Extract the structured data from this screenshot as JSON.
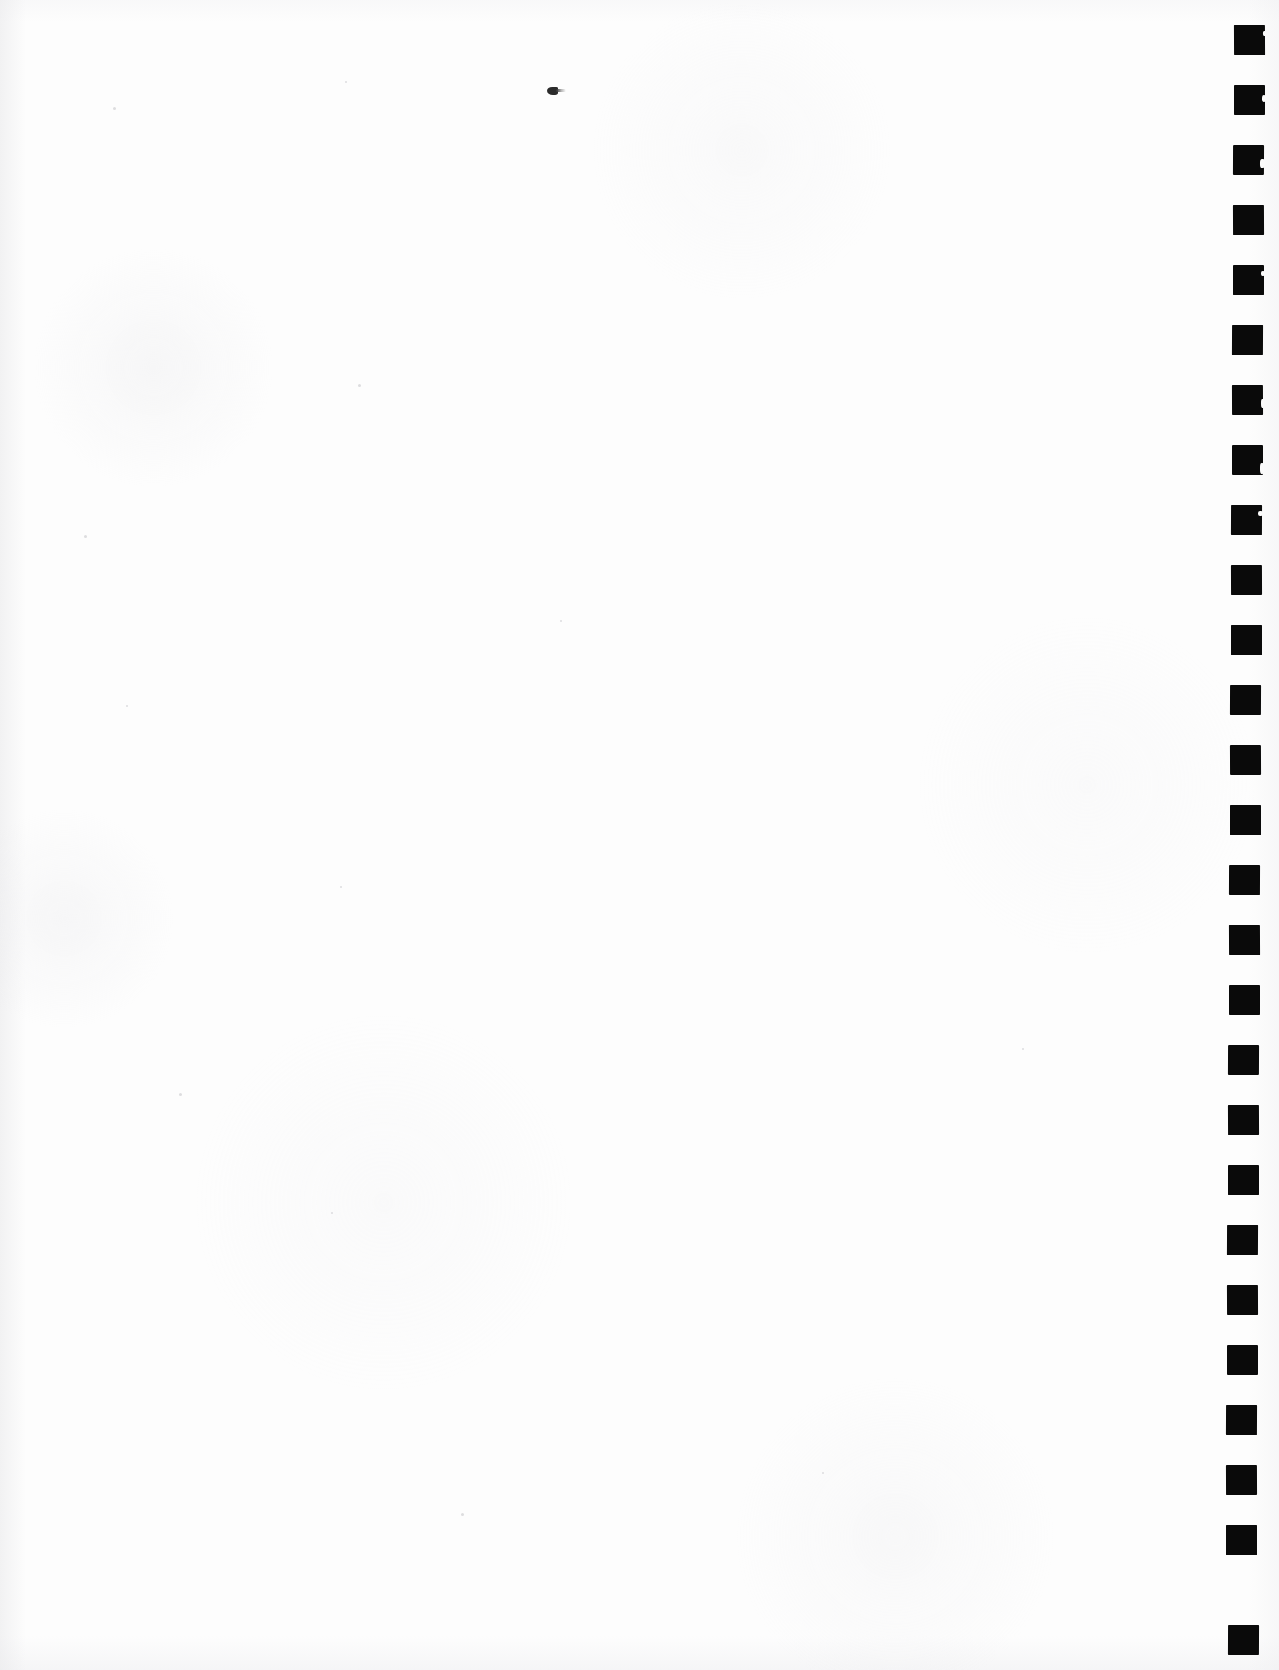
{
  "document": {
    "title": "Scanned Blank Page",
    "page_width": 1279,
    "page_height": 1670,
    "background_color": "#fdfdfd",
    "content_text": "",
    "description": "Blank scanned sheet with a vertical column of solid black registration marks along the right edge"
  },
  "registration_marks": {
    "name": "registration-mark-column",
    "count": 27,
    "color": "#0a0a0a",
    "mark_width": 31,
    "mark_height": 30,
    "spacing": 60,
    "first_top": 25,
    "base_left": 1234,
    "skew_per_mark": -0.22,
    "items": [
      {
        "index": 1,
        "top": 25,
        "left": 1234,
        "nick": true
      },
      {
        "index": 2,
        "top": 85,
        "left": 1234,
        "nick": true
      },
      {
        "index": 3,
        "top": 145,
        "left": 1233,
        "nick": true
      },
      {
        "index": 4,
        "top": 205,
        "left": 1233,
        "nick": false
      },
      {
        "index": 5,
        "top": 265,
        "left": 1233,
        "nick": true
      },
      {
        "index": 6,
        "top": 325,
        "left": 1232,
        "nick": false
      },
      {
        "index": 7,
        "top": 385,
        "left": 1232,
        "nick": true
      },
      {
        "index": 8,
        "top": 445,
        "left": 1232,
        "nick": true
      },
      {
        "index": 9,
        "top": 505,
        "left": 1231,
        "nick": true
      },
      {
        "index": 10,
        "top": 565,
        "left": 1231,
        "nick": false
      },
      {
        "index": 11,
        "top": 625,
        "left": 1231,
        "nick": false
      },
      {
        "index": 12,
        "top": 685,
        "left": 1230,
        "nick": false
      },
      {
        "index": 13,
        "top": 745,
        "left": 1230,
        "nick": false
      },
      {
        "index": 14,
        "top": 805,
        "left": 1230,
        "nick": false
      },
      {
        "index": 15,
        "top": 865,
        "left": 1229,
        "nick": false
      },
      {
        "index": 16,
        "top": 925,
        "left": 1229,
        "nick": false
      },
      {
        "index": 17,
        "top": 985,
        "left": 1229,
        "nick": false
      },
      {
        "index": 18,
        "top": 1045,
        "left": 1228,
        "nick": false
      },
      {
        "index": 19,
        "top": 1105,
        "left": 1228,
        "nick": false
      },
      {
        "index": 20,
        "top": 1165,
        "left": 1228,
        "nick": false
      },
      {
        "index": 21,
        "top": 1225,
        "left": 1227,
        "nick": false
      },
      {
        "index": 22,
        "top": 1285,
        "left": 1227,
        "nick": false
      },
      {
        "index": 23,
        "top": 1345,
        "left": 1227,
        "nick": false
      },
      {
        "index": 24,
        "top": 1405,
        "left": 1226,
        "nick": false
      },
      {
        "index": 25,
        "top": 1465,
        "left": 1226,
        "nick": false
      },
      {
        "index": 26,
        "top": 1525,
        "left": 1226,
        "nick": false
      },
      {
        "index": 27,
        "top": 1625,
        "left": 1228,
        "nick": false
      }
    ]
  },
  "artifacts": {
    "ink_speck": {
      "name": "ink-speck",
      "left": 547,
      "top": 86,
      "color": "#2b2b2b"
    },
    "dust_specks": [
      {
        "left": 113,
        "top": 107,
        "size": 3
      },
      {
        "left": 345,
        "top": 81,
        "size": 2
      },
      {
        "left": 358,
        "top": 384,
        "size": 3
      },
      {
        "left": 84,
        "top": 535,
        "size": 3
      },
      {
        "left": 126,
        "top": 705,
        "size": 2
      },
      {
        "left": 340,
        "top": 886,
        "size": 2
      },
      {
        "left": 179,
        "top": 1093,
        "size": 3
      },
      {
        "left": 331,
        "top": 1212,
        "size": 2
      },
      {
        "left": 461,
        "top": 1513,
        "size": 3
      },
      {
        "left": 822,
        "top": 1472,
        "size": 2
      },
      {
        "left": 1022,
        "top": 1048,
        "size": 2
      },
      {
        "left": 560,
        "top": 620,
        "size": 2
      }
    ]
  }
}
